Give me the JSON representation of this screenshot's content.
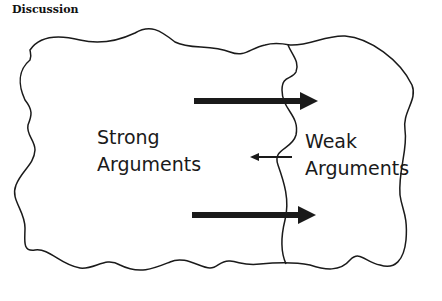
{
  "heading": "Discussion",
  "regions": {
    "strong": {
      "line1": "Strong",
      "line2": "Arguments"
    },
    "weak": {
      "line1": "Weak",
      "line2": "Arguments"
    }
  },
  "arrows": [
    {
      "name": "top-arrow",
      "direction": "right",
      "weight": "thick"
    },
    {
      "name": "middle-arrow",
      "direction": "left",
      "weight": "thin"
    },
    {
      "name": "bottom-arrow",
      "direction": "right",
      "weight": "thick"
    }
  ],
  "colors": {
    "stroke": "#1a1a1a",
    "background": "#ffffff"
  }
}
